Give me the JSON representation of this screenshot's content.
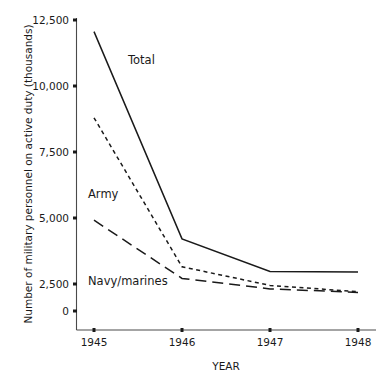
{
  "chart_data": {
    "type": "line",
    "title": "",
    "xlabel": "YEAR",
    "ylabel": "Number of military personnel on active duty (thousands)",
    "x": [
      "1945",
      "1946",
      "1947",
      "1948"
    ],
    "xtick_labels": [
      "1945",
      "1946",
      "1947",
      "1948"
    ],
    "ytick_labels": [
      "0",
      "2,500",
      "5,000",
      "7,500",
      "10,000",
      "12,500"
    ],
    "ytick_values": [
      0,
      2500,
      5000,
      7500,
      10000,
      12500
    ],
    "ylim": [
      0,
      12500
    ],
    "grid": false,
    "legend_position": "inline-labels",
    "series": [
      {
        "name": "Total",
        "label": "Total",
        "style": "solid",
        "color": "#1a1a1a",
        "values": [
          12000,
          3100,
          1700,
          1680
        ]
      },
      {
        "name": "Army",
        "label": "Army",
        "style": "dotted",
        "color": "#1a1a1a",
        "values": [
          8300,
          1900,
          1100,
          830
        ]
      },
      {
        "name": "Navy/marines",
        "label": "Navy/marines",
        "style": "dashed",
        "color": "#1a1a1a",
        "values": [
          3900,
          1400,
          950,
          800
        ]
      }
    ]
  },
  "axis": {
    "y_title": "Number of military personnel on active duty (thousands)",
    "x_title": "YEAR"
  },
  "ticks": {
    "y": [
      {
        "label": "12,500"
      },
      {
        "label": "10,000"
      },
      {
        "label": "7,500"
      },
      {
        "label": "5,000"
      },
      {
        "label": "2,500"
      },
      {
        "label": "0"
      }
    ],
    "x": [
      {
        "label": "1945"
      },
      {
        "label": "1946"
      },
      {
        "label": "1947"
      },
      {
        "label": "1948"
      }
    ]
  },
  "labels": {
    "total": "Total",
    "army": "Army",
    "navy": "Navy/marines"
  }
}
